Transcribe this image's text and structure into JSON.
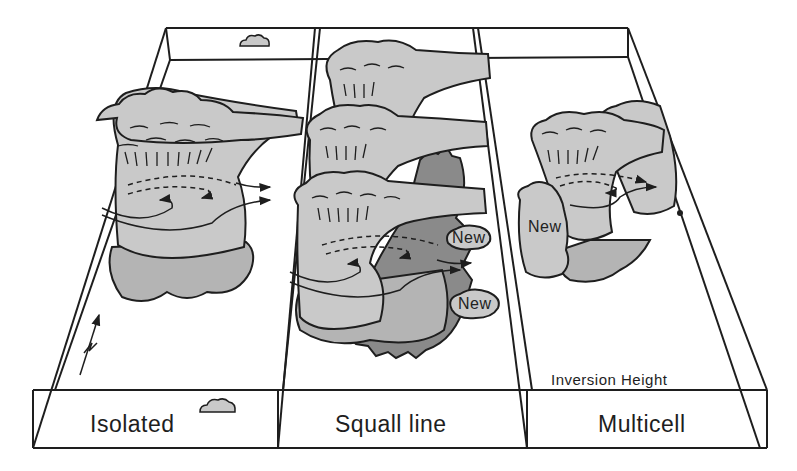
{
  "figure": {
    "panels": [
      {
        "id": "isolated",
        "label": "Isolated"
      },
      {
        "id": "squall-line",
        "label": "Squall line"
      },
      {
        "id": "multicell",
        "label": "Multicell"
      }
    ],
    "annotations": {
      "new_cell_label": "New",
      "new_squall_1": "New",
      "new_squall_2": "New",
      "new_multicell": "New",
      "inversion_height": "Inversion Height"
    },
    "colors": {
      "line": "#1e1e1e",
      "cloud_light": "#c9c9c9",
      "cloud_mid": "#b4b4b4",
      "gust_front": "#8a8a8a",
      "background": "#ffffff"
    }
  }
}
